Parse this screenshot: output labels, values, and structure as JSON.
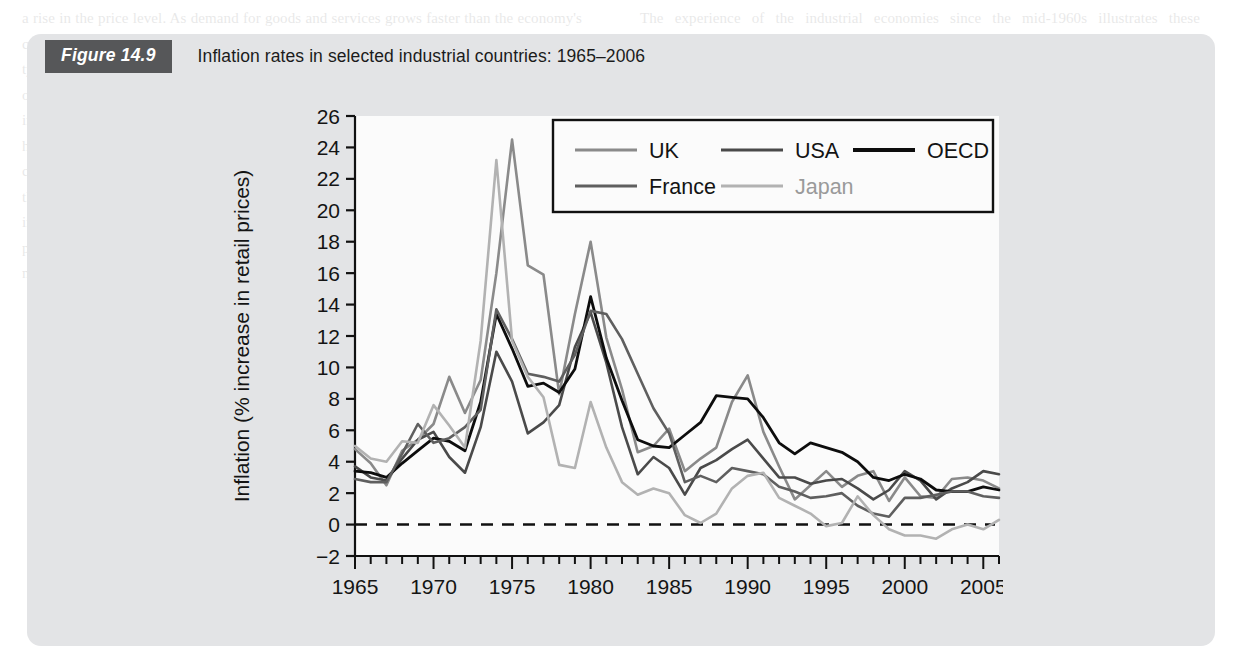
{
  "figure": {
    "badge": "Figure 14.9",
    "title": "Inflation rates in selected industrial countries: 1965–2006",
    "panel_color": "#e3e4e6",
    "badge_color": "#565759"
  },
  "page_background_text": {
    "left_column": "a rise in the price level. As demand for goods and services grows faster than the economy's capacity to supply them, firms respond by raising prices. This demand-pull inflation is typically associated with booms. Cost-push inflation, by contrast, arises from rising costs of production: wage increases in excess of productivity, higher import prices, or increases in indirect taxes. Each of these shifts the aggregate supply curve upwards and leads to a higher price level with lower output. The oil price shocks of 1973–4 and 1979–80 are the classic examples of cost-push inflation, and they are reflected in the twin peaks shown in the chart opposite. Expectations play a crucial role: once workers and firms come to expect inflation, they build it into wage claims and pricing decisions, so inflation becomes self-perpetuating. Breaking such an inflationary spiral may require a sustained period of tight monetary policy and, in the short run, a loss of output and employment.",
    "right_column": "The experience of the industrial economies since the mid-1960s illustrates these mechanisms well. Inflation was low and stable through the 1960s, accelerated sharply in the 1970s and then fell back steadily during the 1980s and 1990s as central banks gave greater priority to price stability. Since the early 1990s most of these countries have achieved inflation rates of around 2 per cent, with Japan experiencing outright deflation for several years. The convergence of inflation rates shown at the right-hand side of the chart is striking, and reflects both the adoption of inflation targeting and the disinflationary effects of globalisation and increased competition in traded goods markets."
  },
  "chart_data": {
    "type": "line",
    "title": "Inflation rates in selected industrial countries: 1965–2006",
    "xlabel": "",
    "ylabel": "Inflation (% increase in retail prices)",
    "xlim": [
      1965,
      2006
    ],
    "ylim": [
      -2,
      26
    ],
    "ytick_step": 2,
    "yticks": [
      -2,
      0,
      2,
      4,
      6,
      8,
      10,
      12,
      14,
      16,
      18,
      20,
      22,
      24,
      26
    ],
    "xticks_major": [
      1965,
      1970,
      1975,
      1980,
      1985,
      1990,
      1995,
      2000,
      2005
    ],
    "xticks_minor_step": 1,
    "grid": false,
    "zero_line": true,
    "zero_line_style": "dashed",
    "legend_position": "top-right-inside",
    "legend_order": [
      "UK",
      "USA",
      "OECD",
      "France",
      "Japan"
    ],
    "x": [
      1965,
      1966,
      1967,
      1968,
      1969,
      1970,
      1971,
      1972,
      1973,
      1974,
      1975,
      1976,
      1977,
      1978,
      1979,
      1980,
      1981,
      1982,
      1983,
      1984,
      1985,
      1986,
      1987,
      1988,
      1989,
      1990,
      1991,
      1992,
      1993,
      1994,
      1995,
      1996,
      1997,
      1998,
      1999,
      2000,
      2001,
      2002,
      2003,
      2004,
      2005,
      2006
    ],
    "series": [
      {
        "name": "UK",
        "color": "#8a8a8a",
        "width": 2.6,
        "values": [
          4.8,
          3.9,
          2.5,
          4.7,
          5.4,
          6.4,
          9.4,
          7.1,
          9.2,
          16.0,
          24.5,
          16.5,
          15.9,
          8.3,
          13.4,
          18.0,
          11.9,
          8.6,
          4.6,
          5.0,
          6.1,
          3.4,
          4.2,
          4.9,
          7.8,
          9.5,
          5.9,
          3.7,
          1.6,
          2.5,
          3.4,
          2.4,
          3.1,
          3.4,
          1.5,
          3.0,
          1.8,
          1.7,
          2.9,
          3.0,
          2.8,
          2.3
        ]
      },
      {
        "name": "USA",
        "color": "#4a4a4a",
        "width": 2.6,
        "values": [
          3.7,
          3.0,
          2.8,
          4.2,
          5.4,
          5.9,
          4.3,
          3.3,
          6.2,
          11.0,
          9.1,
          5.8,
          6.5,
          7.6,
          11.3,
          13.5,
          10.3,
          6.2,
          3.2,
          4.3,
          3.6,
          1.9,
          3.6,
          4.1,
          4.8,
          5.4,
          4.2,
          3.0,
          3.0,
          2.6,
          2.8,
          2.9,
          2.3,
          1.6,
          2.2,
          3.4,
          2.8,
          1.6,
          2.3,
          2.7,
          3.4,
          3.2
        ]
      },
      {
        "name": "OECD",
        "color": "#0d0d0d",
        "width": 2.8,
        "values": [
          3.4,
          3.3,
          3.0,
          3.9,
          4.7,
          5.5,
          5.3,
          4.7,
          7.8,
          13.4,
          11.2,
          8.8,
          9.0,
          8.4,
          9.9,
          14.5,
          10.6,
          7.9,
          5.4,
          5.0,
          4.9,
          5.7,
          6.5,
          8.2,
          8.1,
          8.0,
          6.8,
          5.2,
          4.5,
          5.2,
          4.9,
          4.6,
          4.0,
          3.0,
          2.8,
          3.2,
          2.9,
          2.2,
          2.1,
          2.1,
          2.4,
          2.2
        ]
      },
      {
        "name": "France",
        "color": "#5f5f5f",
        "width": 2.6,
        "values": [
          2.9,
          2.7,
          2.7,
          4.5,
          6.4,
          5.2,
          5.5,
          6.2,
          7.3,
          13.7,
          11.8,
          9.6,
          9.4,
          9.1,
          10.8,
          13.6,
          13.4,
          11.8,
          9.6,
          7.4,
          5.8,
          2.7,
          3.1,
          2.7,
          3.6,
          3.4,
          3.2,
          2.4,
          2.1,
          1.7,
          1.8,
          2.0,
          1.2,
          0.7,
          0.5,
          1.7,
          1.7,
          1.9,
          2.1,
          2.1,
          1.8,
          1.7
        ]
      },
      {
        "name": "Japan",
        "color": "#b2b2b2",
        "width": 2.6,
        "values": [
          5.0,
          4.2,
          4.0,
          5.3,
          5.2,
          7.6,
          6.3,
          4.9,
          11.7,
          23.2,
          11.7,
          9.4,
          8.1,
          3.8,
          3.6,
          7.8,
          4.9,
          2.7,
          1.9,
          2.3,
          2.0,
          0.6,
          0.1,
          0.7,
          2.3,
          3.1,
          3.3,
          1.7,
          1.2,
          0.7,
          -0.1,
          0.1,
          1.8,
          0.6,
          -0.3,
          -0.7,
          -0.7,
          -0.9,
          -0.3,
          0.0,
          -0.3,
          0.3
        ]
      }
    ]
  },
  "legend": {
    "entries": [
      {
        "label": "UK",
        "color": "#8a8a8a"
      },
      {
        "label": "USA",
        "color": "#4a4a4a"
      },
      {
        "label": "OECD",
        "color": "#0d0d0d"
      },
      {
        "label": "France",
        "color": "#5f5f5f"
      },
      {
        "label": "Japan",
        "color": "#b2b2b2"
      }
    ]
  }
}
